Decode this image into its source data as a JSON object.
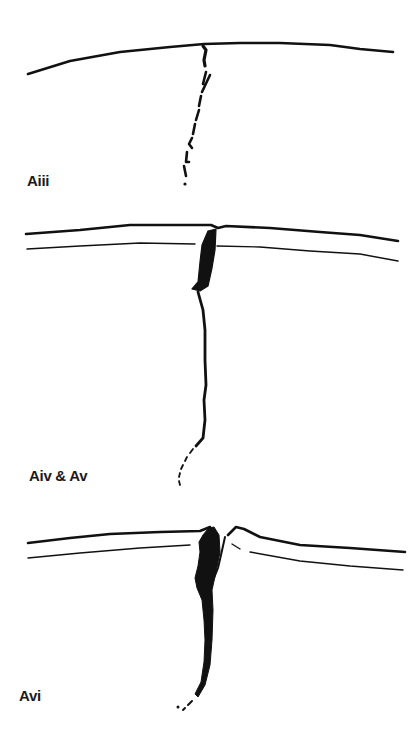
{
  "panels": [
    {
      "id": "Aiii",
      "label": "Aiii"
    },
    {
      "id": "Aiv-Av",
      "label": "Aiv & Av"
    },
    {
      "id": "Avi",
      "label": "Avi"
    }
  ],
  "colors": {
    "ink": "#111111",
    "background": "#ffffff"
  }
}
